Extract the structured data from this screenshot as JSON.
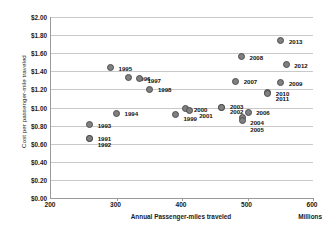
{
  "chart_data": {
    "type": "scatter",
    "title": "",
    "xlabel": "Annual Passenger-miles traveled",
    "ylabel": "Cost per passenger-mile traveled",
    "x_units_label": "Millions",
    "xlim": [
      200,
      600
    ],
    "ylim": [
      0.0,
      2.0
    ],
    "xticks": [
      "200",
      "300",
      "400",
      "500",
      "600"
    ],
    "yticks": [
      "$0.00",
      "$0.20",
      "$0.40",
      "$0.60",
      "$0.80",
      "$1.00",
      "$1.20",
      "$1.40",
      "$1.60",
      "$1.80",
      "$2.00"
    ],
    "grid": true,
    "legend": "none",
    "marker_color": "#808080",
    "marker_edge_color": "#4d4d4d",
    "gridline_color": "#c9c9c9",
    "axis_color": "#9a9a9a",
    "points": [
      {
        "label": "1991",
        "x": 259,
        "y": 0.66,
        "lx": 8,
        "ly": 0
      },
      {
        "label": "1992",
        "x": 259,
        "y": 0.655,
        "lx": 8,
        "ly": 5
      },
      {
        "label": "1993",
        "x": 259,
        "y": 0.81,
        "lx": 8,
        "ly": 0
      },
      {
        "label": "1994",
        "x": 300,
        "y": 0.935,
        "lx": 8,
        "ly": 0
      },
      {
        "label": "1995",
        "x": 291,
        "y": 1.44,
        "lx": 8,
        "ly": 0
      },
      {
        "label": "1996",
        "x": 319,
        "y": 1.33,
        "lx": 8,
        "ly": 0
      },
      {
        "label": "1997",
        "x": 335,
        "y": 1.315,
        "lx": 8,
        "ly": 1
      },
      {
        "label": "1998",
        "x": 351,
        "y": 1.2,
        "lx": 8,
        "ly": 0
      },
      {
        "label": "1999",
        "x": 390,
        "y": 0.92,
        "lx": 8,
        "ly": 3
      },
      {
        "label": "2000",
        "x": 406,
        "y": 0.985,
        "lx": 8,
        "ly": 0
      },
      {
        "label": "2001",
        "x": 411,
        "y": 0.965,
        "lx": 10,
        "ly": 4
      },
      {
        "label": "2002",
        "x": 461,
        "y": 0.995,
        "lx": 8,
        "ly": 3
      },
      {
        "label": "2003",
        "x": 461,
        "y": 0.995,
        "lx": 8,
        "ly": -2
      },
      {
        "label": "2004",
        "x": 492,
        "y": 0.885,
        "lx": 8,
        "ly": 4
      },
      {
        "label": "2005",
        "x": 492,
        "y": 0.855,
        "lx": 8,
        "ly": 8
      },
      {
        "label": "2006",
        "x": 501,
        "y": 0.945,
        "lx": 8,
        "ly": 0
      },
      {
        "label": "2007",
        "x": 482,
        "y": 1.29,
        "lx": 8,
        "ly": 0
      },
      {
        "label": "2008",
        "x": 491,
        "y": 1.56,
        "lx": 8,
        "ly": 0
      },
      {
        "label": "2009",
        "x": 551,
        "y": 1.275,
        "lx": 8,
        "ly": 0
      },
      {
        "label": "2010",
        "x": 531,
        "y": 1.165,
        "lx": 8,
        "ly": 0
      },
      {
        "label": "2011",
        "x": 531,
        "y": 1.155,
        "lx": 8,
        "ly": 5
      },
      {
        "label": "2012",
        "x": 559,
        "y": 1.47,
        "lx": 8,
        "ly": 0
      },
      {
        "label": "2013",
        "x": 551,
        "y": 1.735,
        "lx": 8,
        "ly": 0
      }
    ]
  }
}
